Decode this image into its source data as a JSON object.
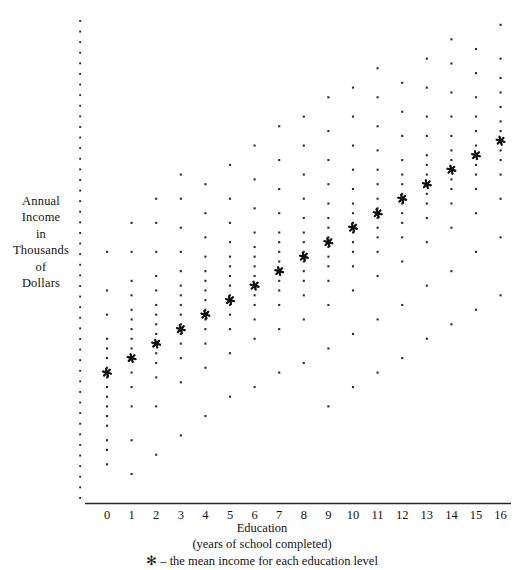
{
  "figure": {
    "title_y_lines": [
      "Annual",
      "Income",
      "in",
      "Thousands",
      "of",
      "Dollars"
    ],
    "xaxis_title": "Education",
    "xaxis_subtitle": "(years of school completed)",
    "legend_note": "✻ – the mean income for each education level",
    "mean_marker_glyph": "✻",
    "colors": {
      "ink": "#15110f",
      "point": "#2b2b2b",
      "mean": "#111111",
      "axis": "#2a2a2a"
    }
  },
  "chart_data": {
    "type": "scatter",
    "title": "",
    "xlabel": "Education (years of school completed)",
    "ylabel": "Annual Income in Thousands of Dollars",
    "grid": false,
    "legend": "✻ – the mean income for each education level",
    "xlim": [
      -0.6,
      16.6
    ],
    "ylim": [
      0,
      100
    ],
    "xticks": [
      0,
      1,
      2,
      3,
      4,
      5,
      6,
      7,
      8,
      9,
      10,
      11,
      12,
      13,
      14,
      15,
      16
    ],
    "xtick_labels": [
      "0",
      "1",
      "2",
      "3",
      "4",
      "5",
      "6",
      "7",
      "8",
      "9",
      "10",
      "11",
      "12",
      "13",
      "14",
      "15",
      "16"
    ],
    "yticks": [],
    "ytick_labels": [],
    "yaxis_style": "dotted-column-no-ticks",
    "series": [
      {
        "name": "observations",
        "marker": "dot",
        "points_by_x": [
          {
            "x": 0,
            "y": [
              8,
              11,
              13,
              16,
              18,
              20,
              22,
              24,
              26,
              28,
              30,
              32,
              34,
              39,
              44,
              52
            ]
          },
          {
            "x": 1,
            "y": [
              6,
              13,
              20,
              24,
              27,
              30,
              32,
              34,
              36,
              38,
              40,
              43,
              46,
              52,
              58
            ]
          },
          {
            "x": 2,
            "y": [
              10,
              20,
              26,
              29,
              31,
              33,
              35,
              37,
              39,
              41,
              44,
              47,
              52,
              58,
              63
            ]
          },
          {
            "x": 3,
            "y": [
              14,
              25,
              30,
              33,
              35,
              37,
              39,
              41,
              43,
              45,
              48,
              52,
              57,
              63,
              68
            ]
          },
          {
            "x": 4,
            "y": [
              18,
              28,
              33,
              36,
              38,
              40,
              42,
              44,
              46,
              48,
              51,
              55,
              60,
              66
            ]
          },
          {
            "x": 5,
            "y": [
              22,
              31,
              36,
              39,
              41,
              43,
              45,
              47,
              49,
              51,
              54,
              58,
              63,
              70
            ]
          },
          {
            "x": 6,
            "y": [
              24,
              34,
              38,
              41,
              43,
              45,
              47,
              49,
              51,
              53,
              56,
              61,
              67,
              74
            ]
          },
          {
            "x": 7,
            "y": [
              27,
              36,
              41,
              44,
              46,
              48,
              50,
              52,
              54,
              56,
              60,
              65,
              71,
              78
            ]
          },
          {
            "x": 8,
            "y": [
              29,
              38,
              43,
              46,
              48,
              50,
              52,
              54,
              56,
              59,
              63,
              68,
              74,
              80
            ]
          },
          {
            "x": 9,
            "y": [
              20,
              32,
              41,
              46,
              49,
              51,
              53,
              55,
              57,
              59,
              62,
              66,
              71,
              77,
              84
            ]
          },
          {
            "x": 10,
            "y": [
              24,
              35,
              44,
              49,
              52,
              54,
              56,
              58,
              60,
              62,
              65,
              69,
              74,
              80,
              86
            ]
          },
          {
            "x": 11,
            "y": [
              27,
              38,
              47,
              52,
              55,
              57,
              59,
              61,
              63,
              66,
              69,
              73,
              78,
              84,
              90
            ]
          },
          {
            "x": 12,
            "y": [
              30,
              41,
              50,
              55,
              58,
              60,
              62,
              64,
              66,
              68,
              71,
              76,
              81,
              87
            ]
          },
          {
            "x": 13,
            "y": [
              34,
              45,
              54,
              59,
              62,
              64,
              66,
              68,
              70,
              72,
              76,
              80,
              86,
              92
            ]
          },
          {
            "x": 14,
            "y": [
              37,
              48,
              57,
              62,
              65,
              67,
              69,
              71,
              73,
              76,
              80,
              85,
              91,
              96
            ]
          },
          {
            "x": 15,
            "y": [
              40,
              52,
              60,
              65,
              68,
              70,
              72,
              74,
              77,
              80,
              84,
              89,
              94
            ]
          },
          {
            "x": 16,
            "y": [
              43,
              55,
              63,
              68,
              71,
              73,
              75,
              77,
              79,
              82,
              85,
              88,
              92,
              99
            ]
          }
        ]
      },
      {
        "name": "mean income per education level",
        "marker": "asterisk",
        "x": [
          0,
          1,
          2,
          3,
          4,
          5,
          6,
          7,
          8,
          9,
          10,
          11,
          12,
          13,
          14,
          15,
          16
        ],
        "values": [
          27,
          30,
          33,
          36,
          39,
          42,
          45,
          48,
          51,
          54,
          57,
          60,
          63,
          66,
          69,
          72,
          75
        ]
      }
    ]
  }
}
